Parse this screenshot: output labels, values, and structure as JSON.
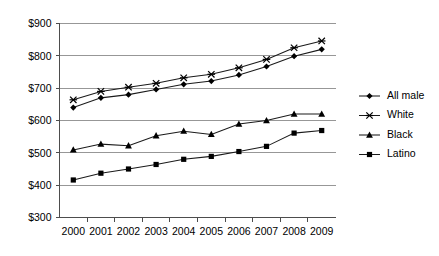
{
  "chart_data": {
    "type": "line",
    "title": "",
    "subtitle": "",
    "xlabel": "",
    "ylabel": "",
    "categories": [
      "2000",
      "2001",
      "2002",
      "2003",
      "2004",
      "2005",
      "2006",
      "2007",
      "2008",
      "2009"
    ],
    "x": [
      2000,
      2001,
      2002,
      2003,
      2004,
      2005,
      2006,
      2007,
      2008,
      2009
    ],
    "ylim": [
      300,
      900
    ],
    "yticks": [
      300,
      400,
      500,
      600,
      700,
      800,
      900
    ],
    "ytick_labels": [
      "$300",
      "$400",
      "$500",
      "$600",
      "$700",
      "$800",
      "$900"
    ],
    "grid": true,
    "legend_position": "right",
    "value_prefix": "$",
    "series": [
      {
        "name": "All male",
        "marker": "diamond",
        "values": [
          640,
          670,
          680,
          696,
          712,
          722,
          741,
          767,
          799,
          820
        ]
      },
      {
        "name": "White",
        "marker": "cross",
        "values": [
          664,
          690,
          703,
          715,
          732,
          743,
          763,
          789,
          825,
          846
        ]
      },
      {
        "name": "Black",
        "marker": "triangle",
        "values": [
          509,
          527,
          522,
          553,
          567,
          557,
          589,
          600,
          620,
          620
        ]
      },
      {
        "name": "Latino",
        "marker": "square",
        "values": [
          416,
          437,
          450,
          464,
          480,
          489,
          504,
          520,
          561,
          569
        ]
      }
    ]
  },
  "legend": {
    "items": [
      {
        "label": "All male"
      },
      {
        "label": "White"
      },
      {
        "label": "Black"
      },
      {
        "label": "Latino"
      }
    ]
  },
  "colors": {
    "series_stroke": "#1a1a1a",
    "gridline": "#8c8c8c",
    "axis": "#4d4d4d",
    "background": "#ffffff",
    "text": "#000000"
  }
}
